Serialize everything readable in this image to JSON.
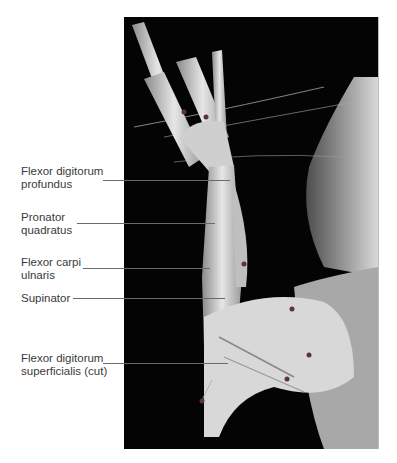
{
  "figure": {
    "type": "anatomical dissection photograph",
    "labels": [
      {
        "text": "Flexor digitorum\nprofundus",
        "top": 165,
        "line_y": 180,
        "line_x1": 112,
        "line_x2": 230
      },
      {
        "text": "Pronator\nquadratus",
        "top": 211,
        "line_y": 223,
        "line_x1": 77,
        "line_x2": 215
      },
      {
        "text": "Flexor carpi\nulnaris",
        "top": 256,
        "line_y": 268,
        "line_x1": 83,
        "line_x2": 210
      },
      {
        "text": "Supinator",
        "top": 292,
        "line_y": 298,
        "line_x1": 72,
        "line_x2": 225
      },
      {
        "text": "Flexor digitorum\nsuperficialis (cut)",
        "top": 352,
        "line_y": 363,
        "line_x1": 112,
        "line_x2": 228
      }
    ]
  }
}
